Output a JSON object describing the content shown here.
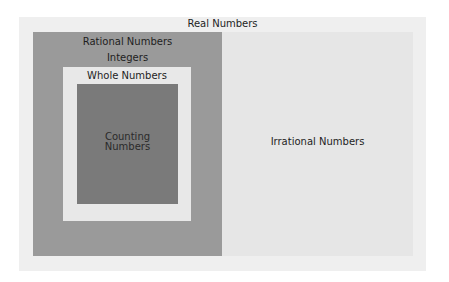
{
  "diagram": {
    "title": "Real Numbers",
    "sets": {
      "real": {
        "label": "Real Numbers",
        "color": "#efefef"
      },
      "rational": {
        "label": "Rational Numbers",
        "color": "#9a9a9a"
      },
      "integers": {
        "label": "Integers",
        "color": "#9a9a9a"
      },
      "whole": {
        "label": "Whole Numbers",
        "color": "#e8e8e8"
      },
      "counting": {
        "label_line1": "Counting",
        "label_line2": "Numbers",
        "color": "#7a7a7a"
      },
      "irrational": {
        "label": "Irrational Numbers",
        "color": "#e6e6e6"
      }
    }
  }
}
